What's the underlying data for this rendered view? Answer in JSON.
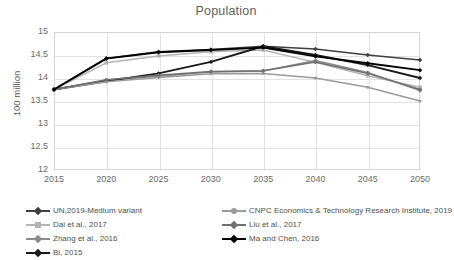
{
  "chart_data": {
    "type": "line",
    "title": "Population",
    "xlabel": "",
    "ylabel": "100 million",
    "x": [
      2015,
      2020,
      2025,
      2030,
      2035,
      2040,
      2045,
      2050
    ],
    "categories": [
      "2015",
      "2020",
      "2025",
      "2030",
      "2035",
      "2040",
      "2045",
      "2050"
    ],
    "xlim": [
      2015,
      2050
    ],
    "ylim": [
      12,
      15
    ],
    "yticks": [
      12,
      12.5,
      13,
      13.5,
      14,
      14.5,
      15
    ],
    "ytick_labels": [
      "12",
      "12.5",
      "13",
      "13.5",
      "14",
      "14.5",
      "15"
    ],
    "grid": true,
    "legend_position": "bottom",
    "series": [
      {
        "name": "UN,2019-Medium variant",
        "color": "#3f3f3f",
        "marker": "diamond",
        "values": [
          13.75,
          14.43,
          14.57,
          14.62,
          14.69,
          14.63,
          14.5,
          14.39
        ]
      },
      {
        "name": "Dai et al., 2017",
        "color": "#b4b4b4",
        "marker": "square",
        "values": [
          13.75,
          14.33,
          14.48,
          14.57,
          14.61,
          14.34,
          14.05,
          13.8
        ]
      },
      {
        "name": "Zhang et al., 2016",
        "color": "#8c8c8c",
        "marker": "diamond",
        "values": [
          13.75,
          13.95,
          14.04,
          14.13,
          14.15,
          14.38,
          14.12,
          13.73
        ]
      },
      {
        "name": "Bi, 2015",
        "color": "#1a1a1a",
        "marker": "diamond",
        "values": [
          13.75,
          13.93,
          14.1,
          14.35,
          14.69,
          14.5,
          14.28,
          14.0
        ]
      },
      {
        "name": "CNPC Economics & Technology Research Institute, 2019",
        "color": "#9a9a9a",
        "marker": "circle",
        "values": [
          13.75,
          13.92,
          14.01,
          14.09,
          14.1,
          14.0,
          13.8,
          13.5
        ]
      },
      {
        "name": "Liu et al., 2017",
        "color": "#707070",
        "marker": "diamond",
        "values": [
          13.75,
          13.96,
          14.06,
          14.14,
          14.16,
          14.35,
          14.1,
          13.75
        ]
      },
      {
        "name": "Ma and Chen, 2016",
        "color": "#000000",
        "marker": "diamond",
        "values": [
          13.75,
          14.42,
          14.56,
          14.61,
          14.66,
          14.47,
          14.32,
          14.17
        ]
      }
    ]
  },
  "legend": {
    "left_column": [
      "UN,2019-Medium variant",
      "Dai et al., 2017",
      "Zhang et al., 2016",
      "Bi, 2015"
    ],
    "right_column": [
      "CNPC Economics & Technology Research Institute, 2019",
      "Liu et al., 2017",
      "Ma and Chen, 2016"
    ]
  }
}
